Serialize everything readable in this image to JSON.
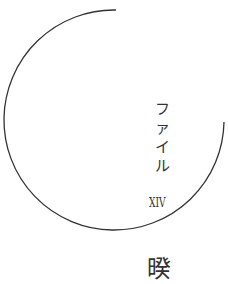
{
  "label": {
    "chars": [
      "フ",
      "ァ",
      "イ",
      "ル"
    ]
  },
  "numeral": "XIV",
  "bottom_glyph": "暌",
  "arc": {
    "color": "#333333",
    "cx": 116,
    "cy": 120,
    "r": 110
  }
}
